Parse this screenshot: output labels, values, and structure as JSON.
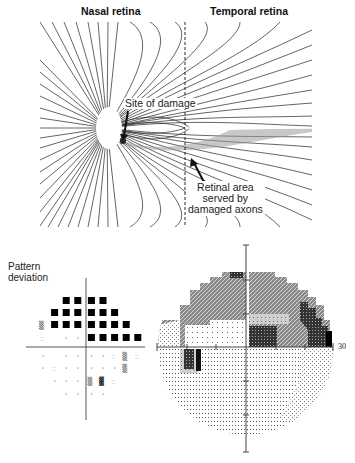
{
  "figure": {
    "top_panel": {
      "headers": {
        "left": "Nasal retina",
        "right": "Temporal retina"
      },
      "annotations": {
        "site_of_damage": "Site of damage",
        "retinal_area": [
          "Retinal area",
          "served by",
          "damaged axons"
        ]
      },
      "features": {
        "optic_disc": "white region at left",
        "vertical_meridian": "dashed",
        "horizontal_raphe": "temporal horizontal boundary"
      }
    },
    "bottom_left_panel": {
      "title_lines": [
        "Pattern",
        "deviation"
      ],
      "grid": {
        "rows_above": [
          {
            "row": 1,
            "cells": [
              "",
              "",
              "B",
              "B",
              "B",
              "B",
              "",
              "",
              ""
            ]
          },
          {
            "row": 2,
            "cells": [
              "",
              "B",
              "B",
              "B",
              "B",
              "B",
              "B",
              "",
              ""
            ]
          },
          {
            "row": 3,
            "cells": [
              "m",
              "B",
              "B",
              "B",
              "B",
              "B",
              "B",
              "B",
              ""
            ]
          },
          {
            "row": 4,
            "cells": [
              "s",
              "",
              ".",
              ".",
              "B",
              "B",
              "B",
              "B",
              "B"
            ]
          }
        ],
        "rows_below": [
          {
            "row": 5,
            "cells": [
              ".",
              "",
              ".",
              ".",
              ".",
              ".",
              "s",
              "m",
              "s"
            ]
          },
          {
            "row": 6,
            "cells": [
              ".",
              "s",
              ".",
              ".",
              ".",
              ".",
              ".",
              "m",
              ""
            ]
          },
          {
            "row": 7,
            "cells": [
              "",
              ".",
              ".",
              ".",
              "m",
              "M",
              "s",
              "",
              ""
            ]
          },
          {
            "row": 8,
            "cells": [
              "",
              "",
              ".",
              ".",
              ".",
              ".",
              "",
              "",
              ""
            ]
          }
        ],
        "legend_hint": "B = black (p<0.5%), M/m = dense symbol, s = sparse symbol, . = normal"
      }
    },
    "bottom_right_panel": {
      "type": "grayscale visual field plot",
      "axis_label_right": "30",
      "defect": "superior arcuate / nasal step, dense superonasal and paracentral loss; small inferotemporal blind-spot-adjacent dark area"
    }
  }
}
